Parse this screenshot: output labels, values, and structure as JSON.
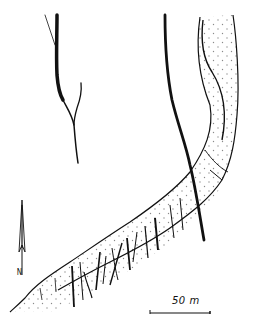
{
  "figure": {
    "type": "geological sketch map",
    "elements": [
      "left branching fault",
      "right thick fault",
      "dotted (stippled) curved band with cross fractures",
      "north arrow",
      "scale bar"
    ]
  },
  "north_arrow": {
    "label": "N",
    "icon": "north-arrow-icon"
  },
  "scale_bar": {
    "label": "50 m",
    "length_px": 80
  },
  "colors": {
    "ink": "#111111",
    "background": "#ffffff",
    "stipple": "#9a9a9a"
  }
}
